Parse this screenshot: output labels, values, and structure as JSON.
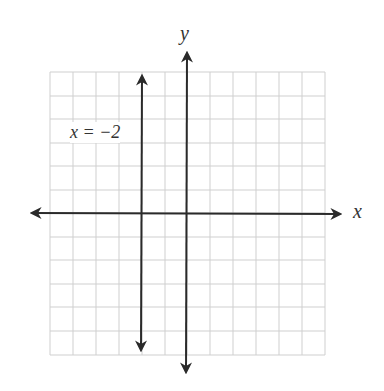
{
  "graph": {
    "axis_x_label": "x",
    "axis_y_label": "y",
    "line_label": "x = −2",
    "line_equation": "x = -2",
    "grid": {
      "columns": 12,
      "rows": 12,
      "x_range": [
        -6,
        6
      ],
      "y_range": [
        -6,
        6
      ]
    },
    "colors": {
      "grid": "#c8c8c8",
      "axis": "#2a2a2a",
      "line": "#2a2a2a"
    }
  }
}
